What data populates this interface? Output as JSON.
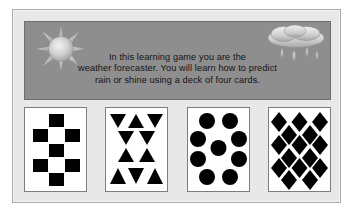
{
  "app": {
    "title": "Weather Forecaster Learning Game",
    "screen_name": "intro-screen"
  },
  "panel": {
    "background_color": "#e8e8e8",
    "border_color": "#a9a9a9"
  },
  "banner": {
    "background_color": "#8e8e8e",
    "border_color": "#6f6f6f",
    "text_color": "#141414",
    "lines": [
      "In this learning game you are the",
      "weather forecaster. You will learn how to predict",
      "rain or shine using a deck of four cards."
    ],
    "full_text": "In this learning game you are the weather forecaster. You will learn how to predict rain or shine using a deck of four cards.",
    "icons": {
      "sun": "sun-icon",
      "cloud": "rain-cloud-icon"
    }
  },
  "cards": [
    {
      "name": "card-squares",
      "symbol": "square",
      "symbol_label": "Squares",
      "count": 7,
      "fill_color": "#000000",
      "card_color": "#ffffff"
    },
    {
      "name": "card-triangles",
      "symbol": "triangle",
      "symbol_label": "Triangles",
      "count": 10,
      "fill_color": "#000000",
      "card_color": "#ffffff"
    },
    {
      "name": "card-circles",
      "symbol": "circle",
      "symbol_label": "Circles",
      "count": 9,
      "fill_color": "#000000",
      "card_color": "#ffffff"
    },
    {
      "name": "card-diamonds",
      "symbol": "diamond",
      "symbol_label": "Diamonds",
      "count": 22,
      "fill_color": "#000000",
      "card_color": "#ffffff"
    }
  ]
}
